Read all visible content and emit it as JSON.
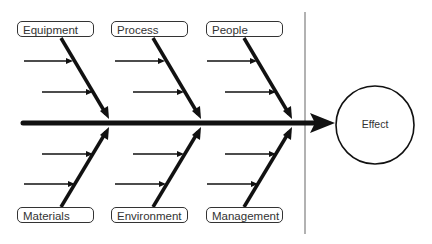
{
  "diagram": {
    "type": "fishbone",
    "effect": "Effect",
    "categories_top": [
      "Equipment",
      "Process",
      "People"
    ],
    "categories_bottom": [
      "Materials",
      "Environment",
      "Management"
    ],
    "causes_per_category": 2,
    "colors": {
      "lines": "#111111",
      "divider": "#999999",
      "box_border": "#333333",
      "text": "#333333"
    }
  }
}
